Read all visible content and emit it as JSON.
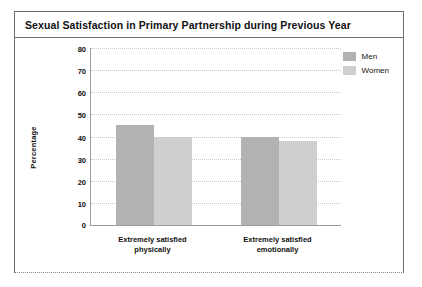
{
  "figure": {
    "title": "Sexual Satisfaction in Primary Partnership during Previous Year"
  },
  "legend": {
    "position": "top-right",
    "entries": [
      {
        "label": "Men",
        "color": "#b2b2b2",
        "icon": "legend-swatch"
      },
      {
        "label": "Women",
        "color": "#cfcfcf",
        "icon": "legend-swatch"
      }
    ]
  },
  "chart_data": {
    "type": "bar",
    "title": "Sexual Satisfaction in Primary Partnership during Previous Year",
    "xlabel": "",
    "ylabel": "Percentage",
    "categories": [
      "Extremely satisfied physically",
      "Extremely satisfied emotionally"
    ],
    "category_lines": [
      [
        "Extremely satisfied",
        "physically"
      ],
      [
        "Extremely satisfied",
        "emotionally"
      ]
    ],
    "series": [
      {
        "name": "Men",
        "color": "#b2b2b2",
        "values": [
          45,
          40
        ]
      },
      {
        "name": "Women",
        "color": "#cfcfcf",
        "values": [
          40,
          38
        ]
      }
    ],
    "ylim": [
      0,
      80
    ],
    "yticks": [
      80,
      70,
      60,
      50,
      40,
      30,
      20,
      10,
      0
    ],
    "ytick_labels": [
      "80",
      "70",
      "60",
      "50",
      "40",
      "30",
      "20",
      "10",
      "0"
    ],
    "grid": "horizontal-dotted",
    "legend_position": "top-right"
  }
}
